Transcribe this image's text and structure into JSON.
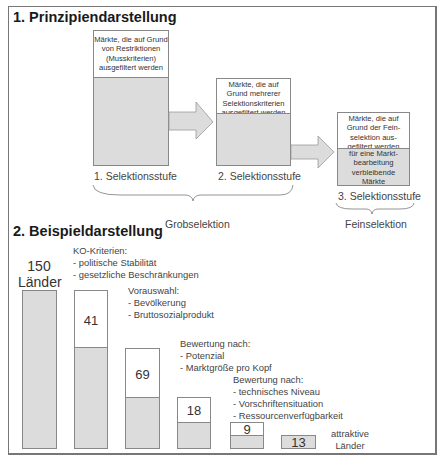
{
  "section1": {
    "title": "1. Prinzipiendarstellung",
    "stages": [
      {
        "box_text": "Märkte, die auf Grund von Restriktionen (Musskriterien) ausgefiltert werden",
        "label": "1. Selektionsstufe"
      },
      {
        "box_text": "Märkte, die auf Grund mehrerer Selektionskriterien ausgefiltert werden",
        "label": "2. Selektionsstufe"
      },
      {
        "box_text": "Märkte, die auf Grund der Feinselektion ausgefiltert werden",
        "remaining_text": "für eine Marktbearbeitung verbleibende Märkte",
        "label": "3. Selektionsstufe"
      }
    ],
    "stage1_lines": [
      "Märkte, die auf Grund",
      "von Restriktionen",
      "(Musskriterien)",
      "ausgefiltert werden"
    ],
    "stage2_lines": [
      "Märkte, die auf",
      "Grund mehrerer",
      "Selektionskriterien",
      "ausgefiltert werden"
    ],
    "stage3_lines": [
      "Märkte, die auf",
      "Grund der Fein-",
      "selektion aus-",
      "gefiltert werden"
    ],
    "stage3_remaining_lines": [
      "für eine Markt-",
      "bearbeitung",
      "verbleibende",
      "Märkte"
    ],
    "braces": {
      "grob": "Grobselektion",
      "fein": "Feinselektion"
    }
  },
  "section2": {
    "title": "2. Beispieldarstellung",
    "start": {
      "count": "150",
      "unit": "Länder"
    },
    "steps": [
      {
        "filtered": "41",
        "title": "KO-Kriterien:",
        "criteria": [
          "- politische Stabilität",
          "- gesetzliche Beschränkungen"
        ]
      },
      {
        "filtered": "69",
        "title": "Vorauswahl:",
        "criteria": [
          "- Bevölkerung",
          "- Bruttosozialprodukt"
        ]
      },
      {
        "filtered": "18",
        "title": "Bewertung nach:",
        "criteria": [
          "- Potenzial",
          "- Marktgröße pro Kopf"
        ]
      },
      {
        "filtered": "9",
        "title": "Bewertung nach:",
        "criteria": [
          "- technisches Niveau",
          "- Vorschriftensituation",
          "- Ressourcenverfügbarkeit"
        ]
      }
    ],
    "result": {
      "count": "13",
      "label_line1": "attraktive",
      "label_line2": "Länder"
    }
  },
  "colors": {
    "gray_fill": "#dcdcdc",
    "border": "#888888",
    "frame": "#777777"
  }
}
